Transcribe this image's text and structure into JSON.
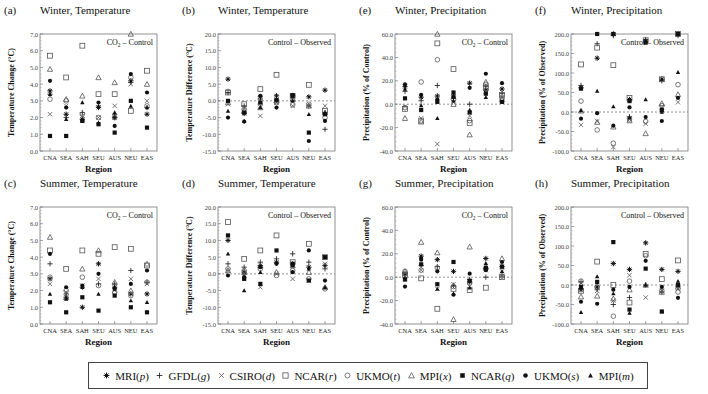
{
  "figure": {
    "regions": [
      "CNA",
      "SEA",
      "SAH",
      "SEU",
      "AUS",
      "NEU",
      "EAS"
    ],
    "xlabel": "Region"
  },
  "legend": {
    "items": [
      {
        "model": "MRI",
        "code": "p",
        "marker": "asterisk"
      },
      {
        "model": "GFDL",
        "code": "g",
        "marker": "plus"
      },
      {
        "model": "CSIRO",
        "code": "d",
        "marker": "cross"
      },
      {
        "model": "NCAR",
        "code": "r",
        "marker": "open-square"
      },
      {
        "model": "UKMO",
        "code": "t",
        "marker": "open-circle"
      },
      {
        "model": "MPI",
        "code": "x",
        "marker": "open-triangle"
      },
      {
        "model": "NCAR",
        "code": "q",
        "marker": "filled-square"
      },
      {
        "model": "UKMO",
        "code": "s",
        "marker": "filled-circle"
      },
      {
        "model": "MPI",
        "code": "m",
        "marker": "filled-triangle"
      }
    ]
  },
  "chart_data": [
    {
      "id": "a",
      "label": "(a)",
      "title": "Winter, Temperature",
      "type": "scatter",
      "annotation": "CO2 – Control",
      "annotation_sub": "2",
      "ylabel": "Temperature Change (°C)",
      "ylim": [
        0,
        7
      ],
      "yticks": [
        0,
        1,
        2,
        3,
        4,
        5,
        6,
        7
      ],
      "tick_fmt": 1,
      "zero_line": false,
      "series": {
        "p": [
          3.6,
          2.2,
          1.9,
          2.6,
          2.0,
          4.2,
          2.2
        ],
        "g": [
          3.4,
          2.0,
          2.3,
          2.7,
          2.2,
          4.1,
          2.6
        ],
        "d": [
          2.2,
          2.7,
          2.1,
          2.0,
          2.7,
          4.0,
          3.0
        ],
        "r": [
          5.7,
          4.4,
          6.3,
          3.4,
          3.4,
          2.4,
          4.8
        ],
        "t": [
          3.1,
          3.0,
          2.2,
          2.0,
          2.0,
          4.4,
          2.7
        ],
        "x": [
          4.9,
          3.1,
          3.3,
          4.4,
          4.1,
          7.0,
          4.0
        ],
        "q": [
          0.9,
          0.9,
          1.8,
          1.6,
          1.1,
          3.0,
          1.4
        ],
        "s": [
          4.2,
          2.6,
          1.8,
          2.9,
          1.5,
          4.6,
          3.5
        ],
        "m": [
          3.4,
          1.9,
          2.9,
          1.7,
          2.3,
          2.7,
          2.6
        ]
      }
    },
    {
      "id": "b",
      "label": "(b)",
      "title": "Winter, Temperature",
      "type": "scatter",
      "annotation": "Control – Observed",
      "annotation_sub": "",
      "ylabel": "Temperature Difference (°C)",
      "ylim": [
        -15,
        20
      ],
      "yticks": [
        -15,
        -10,
        -5,
        0,
        5,
        10,
        15,
        20
      ],
      "tick_fmt": 1,
      "zero_line": true,
      "series": {
        "p": [
          6.5,
          -3.8,
          1.2,
          1.5,
          1.5,
          1.2,
          3.2
        ],
        "g": [
          2.5,
          -1.5,
          0.5,
          0.5,
          0.2,
          -1.5,
          -8.5
        ],
        "d": [
          -1.0,
          -2.0,
          -4.5,
          -0.5,
          -1.5,
          -1.5,
          -1.5
        ],
        "r": [
          2.5,
          -1.0,
          3.5,
          7.8,
          1.5,
          4.8,
          -3.0
        ],
        "t": [
          2.8,
          -2.5,
          -1.0,
          -0.5,
          -1.2,
          -1.0,
          -5.0
        ],
        "x": [
          -0.5,
          -3.0,
          -2.0,
          0.0,
          0.5,
          -1.5,
          -3.5
        ],
        "q": [
          0.0,
          -3.5,
          -0.5,
          0.2,
          1.5,
          -9.5,
          -4.0
        ],
        "s": [
          -5.0,
          -6.2,
          1.5,
          -2.0,
          1.8,
          -12.0,
          -6.0
        ],
        "m": [
          -3.0,
          -6.0,
          -2.0,
          0.5,
          0.0,
          -4.0,
          -3.5
        ]
      }
    },
    {
      "id": "e",
      "label": "(e)",
      "title": "Winter, Precipitation",
      "type": "scatter",
      "annotation": "CO2 – Control",
      "annotation_sub": "2",
      "ylabel": "Precipitation (% of Control)",
      "ylim": [
        -40,
        60
      ],
      "yticks": [
        -40,
        -20,
        0,
        20,
        40,
        60
      ],
      "tick_fmt": 1,
      "zero_line": true,
      "series": {
        "p": [
          15,
          6,
          7,
          7,
          18,
          12,
          13
        ],
        "g": [
          11,
          3,
          16,
          5,
          0,
          15,
          9
        ],
        "d": [
          -2,
          -12,
          -34,
          2,
          -10,
          11,
          6
        ],
        "r": [
          -4,
          -14,
          52,
          30,
          -16,
          14,
          8
        ],
        "t": [
          -3,
          19,
          38,
          4,
          -14,
          17,
          5
        ],
        "x": [
          -12,
          -15,
          60,
          0,
          -26,
          19,
          4
        ],
        "q": [
          5,
          -5,
          2,
          10,
          -7,
          9,
          2
        ],
        "s": [
          17,
          8,
          4,
          6,
          14,
          26,
          18
        ],
        "m": [
          13,
          -1,
          -12,
          3,
          -5,
          6,
          2
        ]
      }
    },
    {
      "id": "f",
      "label": "(f)",
      "title": "Winter, Precipitation",
      "type": "scatter",
      "annotation": "Control – Observed",
      "annotation_sub": "",
      "ylabel": "Precipitation (% of Observed)",
      "ylim": [
        -100,
        200
      ],
      "yticks": [
        -100,
        -50,
        0,
        50,
        100,
        150,
        200
      ],
      "tick_fmt": 1,
      "zero_line": true,
      "series": {
        "p": [
          62,
          138,
          200,
          32,
          182,
          84,
          200
        ],
        "g": [
          68,
          175,
          196,
          -12,
          186,
          80,
          196
        ],
        "d": [
          -33,
          -24,
          -90,
          -18,
          -30,
          12,
          25
        ],
        "r": [
          122,
          165,
          120,
          36,
          184,
          84,
          200
        ],
        "t": [
          28,
          -46,
          -80,
          -18,
          -24,
          16,
          70
        ],
        "x": [
          3,
          -26,
          -38,
          -22,
          -55,
          22,
          45
        ],
        "q": [
          60,
          200,
          200,
          28,
          178,
          5,
          200
        ],
        "s": [
          -17,
          -3,
          -35,
          12,
          -13,
          -23,
          36
        ],
        "m": [
          4,
          54,
          14,
          -14,
          32,
          0,
          102
        ]
      }
    },
    {
      "id": "c",
      "label": "(c)",
      "title": "Summer, Temperature",
      "type": "scatter",
      "annotation": "CO2 – Control",
      "annotation_sub": "2",
      "ylabel": "Temperature Change (°C)",
      "ylim": [
        0,
        7
      ],
      "yticks": [
        0,
        1,
        2,
        3,
        4,
        5,
        6,
        7
      ],
      "tick_fmt": 1,
      "zero_line": false,
      "series": {
        "p": [
          2.7,
          1.6,
          1.0,
          3.6,
          2.2,
          1.8,
          1.8
        ],
        "g": [
          3.6,
          1.8,
          2.2,
          2.4,
          2.4,
          3.2,
          2.5
        ],
        "d": [
          2.4,
          1.9,
          2.3,
          2.7,
          2.0,
          2.7,
          2.4
        ],
        "r": [
          4.4,
          3.3,
          4.4,
          4.2,
          4.6,
          4.5,
          3.5
        ],
        "t": [
          2.8,
          2.0,
          2.8,
          2.3,
          1.9,
          1.7,
          2.5
        ],
        "x": [
          5.2,
          1.6,
          3.3,
          4.4,
          2.5,
          2.0,
          3.6
        ],
        "q": [
          1.3,
          0.7,
          1.6,
          0.8,
          1.7,
          1.0,
          0.7
        ],
        "s": [
          4.2,
          2.2,
          2.3,
          3.0,
          2.1,
          2.4,
          3.2
        ],
        "m": [
          1.8,
          1.5,
          2.2,
          1.8,
          2.2,
          1.4,
          1.3
        ]
      }
    },
    {
      "id": "d",
      "label": "(d)",
      "title": "Summer, Temperature",
      "type": "scatter",
      "annotation": "Control – Observed",
      "annotation_sub": "",
      "ylabel": "Temperature Difference (°C)",
      "ylim": [
        -15,
        20
      ],
      "yticks": [
        -15,
        -10,
        -5,
        0,
        5,
        10,
        15,
        20
      ],
      "tick_fmt": 1,
      "zero_line": true,
      "series": {
        "p": [
          10.0,
          0.5,
          2.5,
          3.5,
          3.0,
          2.0,
          2.5
        ],
        "g": [
          3.0,
          2.0,
          3.5,
          4.5,
          6.0,
          3.5,
          1.5
        ],
        "d": [
          1.0,
          -0.5,
          -4.0,
          0.0,
          -1.5,
          -2.0,
          3.0
        ],
        "r": [
          15.5,
          4.5,
          7.0,
          11.5,
          3.5,
          9.0,
          5.0
        ],
        "t": [
          1.5,
          1.0,
          1.5,
          -0.5,
          1.0,
          -1.5,
          -4.5
        ],
        "x": [
          1.0,
          0.5,
          2.5,
          0.5,
          2.5,
          0.5,
          -4.0
        ],
        "q": [
          11.5,
          -1.5,
          -3.0,
          7.0,
          3.0,
          -2.0,
          5.0
        ],
        "s": [
          -0.5,
          -1.0,
          2.0,
          3.0,
          0.5,
          7.0,
          -2.0
        ],
        "m": [
          6.0,
          -5.0,
          0.5,
          3.5,
          2.5,
          1.5,
          -4.0
        ]
      }
    },
    {
      "id": "g",
      "label": "(g)",
      "title": "Summer, Precipitation",
      "type": "scatter",
      "annotation": "CO2 – Control",
      "annotation_sub": "2",
      "ylabel": "Precipitation (% of Control)",
      "ylim": [
        -40,
        60
      ],
      "yticks": [
        -40,
        -20,
        0,
        20,
        40,
        60
      ],
      "tick_fmt": 1,
      "zero_line": true,
      "series": {
        "p": [
          3,
          18,
          15,
          5,
          -4,
          16,
          9
        ],
        "g": [
          2,
          10,
          9,
          -7,
          -2,
          0,
          1
        ],
        "d": [
          1,
          6,
          -10,
          -6,
          -8,
          6,
          5
        ],
        "r": [
          2,
          -1,
          -27,
          -10,
          -11,
          -9,
          0
        ],
        "t": [
          5,
          6,
          8,
          -8,
          -5,
          7,
          1
        ],
        "x": [
          5,
          30,
          21,
          -36,
          26,
          9,
          16
        ],
        "q": [
          -2,
          11,
          -6,
          13,
          -3,
          8,
          9
        ],
        "s": [
          -8,
          15,
          5,
          -15,
          3,
          6,
          13
        ],
        "m": [
          -1,
          17,
          -10,
          -14,
          -9,
          12,
          5
        ]
      }
    },
    {
      "id": "h",
      "label": "(h)",
      "title": "Summer, Precipitation",
      "type": "scatter",
      "annotation": "Control – Observed",
      "annotation_sub": "",
      "ylabel": "Precipitation (% of Observed)",
      "ylim": [
        -100,
        200
      ],
      "yticks": [
        -100,
        -50,
        0,
        50,
        100,
        150,
        200
      ],
      "tick_fmt": 1,
      "zero_line": true,
      "series": {
        "p": [
          -12,
          -5,
          55,
          40,
          108,
          40,
          35
        ],
        "g": [
          8,
          -12,
          -50,
          -32,
          0,
          -18,
          -5
        ],
        "d": [
          5,
          -15,
          -40,
          25,
          -32,
          -15,
          -10
        ],
        "r": [
          -15,
          60,
          0,
          -45,
          80,
          15,
          63
        ],
        "t": [
          10,
          -5,
          -80,
          10,
          75,
          -15,
          -18
        ],
        "x": [
          -30,
          -28,
          -35,
          -12,
          0,
          -18,
          -5
        ],
        "q": [
          -5,
          8,
          110,
          -63,
          42,
          -68,
          0
        ],
        "s": [
          -43,
          -48,
          -12,
          -5,
          62,
          -5,
          -33
        ],
        "m": [
          -70,
          22,
          -22,
          -72,
          0,
          -68,
          10
        ]
      }
    }
  ],
  "layout": {
    "panels": [
      {
        "id": "a",
        "left": 0,
        "top": 0
      },
      {
        "id": "b",
        "left": 178,
        "top": 0
      },
      {
        "id": "e",
        "left": 355,
        "top": 0
      },
      {
        "id": "f",
        "left": 531,
        "top": 0
      },
      {
        "id": "c",
        "left": 0,
        "top": 173
      },
      {
        "id": "d",
        "left": 178,
        "top": 173
      },
      {
        "id": "g",
        "left": 355,
        "top": 173
      },
      {
        "id": "h",
        "left": 531,
        "top": 173
      }
    ]
  }
}
